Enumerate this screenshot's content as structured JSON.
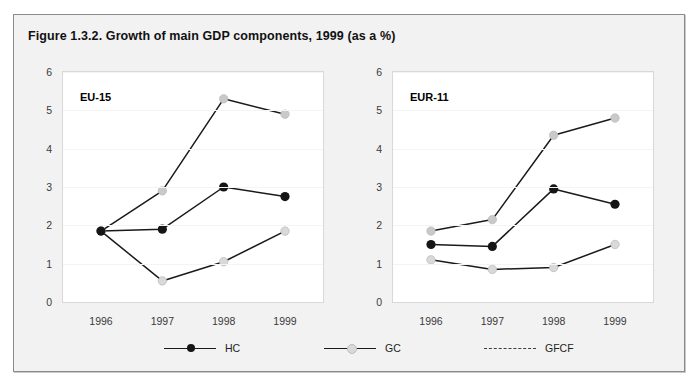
{
  "figure": {
    "title": "Figure 1.3.2. Growth of main GDP components, 1999 (as a %)"
  },
  "legend": {
    "items": [
      {
        "label": "HC",
        "marker": "filled-black-circle",
        "line": "solid",
        "color": "#151515"
      },
      {
        "label": "GC",
        "marker": "light-gray-circle",
        "line": "solid",
        "color": "#d9d9d9"
      },
      {
        "label": "GFCF",
        "marker": "none",
        "line": "dashed",
        "color": "#3d3d3d"
      }
    ]
  },
  "colors": {
    "line": "#1a1a1a",
    "hc_marker": "#151515",
    "gc_marker": "#d9d9d9",
    "gfcf_marker": "#c9c9c9",
    "panel_background": "#ffffff",
    "figure_background": "#f2f2f2",
    "figure_border": "#8a8a8a",
    "gridline": "#f4f4f4"
  },
  "chart_data": [
    {
      "type": "line",
      "title": "EU-15",
      "xlabel": "",
      "ylabel": "",
      "x": [
        "1996",
        "1997",
        "1998",
        "1999"
      ],
      "xticklabels": [
        "1996",
        "1997",
        "1998",
        "1999"
      ],
      "yticklabels": [
        "0",
        "1",
        "2",
        "3",
        "4",
        "5",
        "6"
      ],
      "ylim": [
        0,
        6
      ],
      "grid": true,
      "legend_position": "bottom-shared",
      "series": [
        {
          "name": "HC",
          "values": [
            1.85,
            1.9,
            3.0,
            2.75
          ]
        },
        {
          "name": "GC",
          "values": [
            1.85,
            0.55,
            1.05,
            1.85
          ]
        },
        {
          "name": "GFCF",
          "values": [
            1.85,
            2.9,
            5.3,
            4.9
          ]
        }
      ]
    },
    {
      "type": "line",
      "title": "EUR-11",
      "xlabel": "",
      "ylabel": "",
      "x": [
        "1996",
        "1997",
        "1998",
        "1999"
      ],
      "xticklabels": [
        "1996",
        "1997",
        "1998",
        "1999"
      ],
      "yticklabels": [
        "0",
        "1",
        "2",
        "3",
        "4",
        "5",
        "6"
      ],
      "ylim": [
        0,
        6
      ],
      "grid": true,
      "legend_position": "bottom-shared",
      "series": [
        {
          "name": "HC",
          "values": [
            1.5,
            1.45,
            2.95,
            2.55
          ]
        },
        {
          "name": "GC",
          "values": [
            1.1,
            0.85,
            0.9,
            1.5
          ]
        },
        {
          "name": "GFCF",
          "values": [
            1.85,
            2.15,
            4.35,
            4.8
          ]
        }
      ]
    }
  ]
}
